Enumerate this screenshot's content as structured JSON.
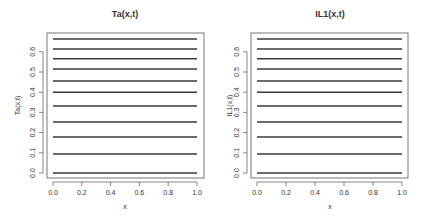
{
  "chart_data": [
    {
      "type": "line",
      "title": "Ta(x,t)",
      "xlabel": "x",
      "ylabel": "Ta(x,t)",
      "xlim": [
        0.0,
        1.0
      ],
      "ylim": [
        0.0,
        0.67
      ],
      "x_ticks": [
        "0.0",
        "0.2",
        "0.4",
        "0.6",
        "0.8",
        "1.0"
      ],
      "y_ticks": [
        "0.0",
        "0.1",
        "0.2",
        "0.3",
        "0.4",
        "0.5",
        "0.6"
      ],
      "grid": false,
      "legend": null,
      "x": [
        0.0,
        1.0
      ],
      "series": [
        {
          "name": "t1",
          "values": [
            0.0,
            0.0
          ]
        },
        {
          "name": "t2",
          "values": [
            0.094,
            0.094
          ]
        },
        {
          "name": "t3",
          "values": [
            0.178,
            0.178
          ]
        },
        {
          "name": "t4",
          "values": [
            0.252,
            0.252
          ]
        },
        {
          "name": "t5",
          "values": [
            0.332,
            0.332
          ]
        },
        {
          "name": "t6",
          "values": [
            0.4,
            0.4
          ]
        },
        {
          "name": "t7",
          "values": [
            0.455,
            0.455
          ]
        },
        {
          "name": "t8",
          "values": [
            0.515,
            0.515
          ]
        },
        {
          "name": "t9",
          "values": [
            0.565,
            0.565
          ]
        },
        {
          "name": "t10",
          "values": [
            0.614,
            0.614
          ]
        },
        {
          "name": "t11",
          "values": [
            0.663,
            0.663
          ]
        }
      ]
    },
    {
      "type": "line",
      "title": "IL1(x,t)",
      "xlabel": "x",
      "ylabel": "IL1(x,t)",
      "xlim": [
        0.0,
        1.0
      ],
      "ylim": [
        0.0,
        0.67
      ],
      "x_ticks": [
        "0.0",
        "0.2",
        "0.4",
        "0.6",
        "0.8",
        "1.0"
      ],
      "y_ticks": [
        "0.0",
        "0.1",
        "0.2",
        "0.3",
        "0.4",
        "0.5",
        "0.6"
      ],
      "grid": false,
      "legend": null,
      "x": [
        0.0,
        1.0
      ],
      "series": [
        {
          "name": "t1",
          "values": [
            0.0,
            0.0
          ]
        },
        {
          "name": "t2",
          "values": [
            0.094,
            0.094
          ]
        },
        {
          "name": "t3",
          "values": [
            0.178,
            0.178
          ]
        },
        {
          "name": "t4",
          "values": [
            0.252,
            0.252
          ]
        },
        {
          "name": "t5",
          "values": [
            0.332,
            0.332
          ]
        },
        {
          "name": "t6",
          "values": [
            0.4,
            0.4
          ]
        },
        {
          "name": "t7",
          "values": [
            0.455,
            0.455
          ]
        },
        {
          "name": "t8",
          "values": [
            0.515,
            0.515
          ]
        },
        {
          "name": "t9",
          "values": [
            0.565,
            0.565
          ]
        },
        {
          "name": "t10",
          "values": [
            0.614,
            0.614
          ]
        },
        {
          "name": "t11",
          "values": [
            0.663,
            0.663
          ]
        }
      ]
    }
  ],
  "style": {
    "line_color": "#3a3a3a",
    "axis_color": "#555555",
    "text_color": "#333333"
  }
}
